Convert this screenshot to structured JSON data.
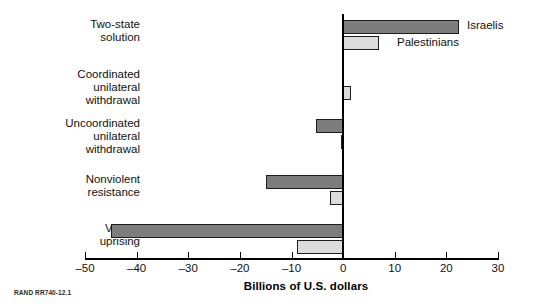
{
  "chart_data": {
    "type": "bar",
    "orientation": "horizontal",
    "title": "",
    "subtitle": "",
    "xlabel": "Billions of U.S. dollars",
    "ylabel": "",
    "xlim": [
      -50,
      30
    ],
    "xticks": [
      -50,
      -40,
      -30,
      -20,
      -10,
      0,
      10,
      20,
      30
    ],
    "xtick_labels": [
      "–50",
      "–40",
      "–30",
      "–20",
      "–10",
      "0",
      "10",
      "20",
      "30"
    ],
    "grid": false,
    "legend_position": "inline-right-of-bars",
    "categories": [
      "Two-state\nsolution",
      "Coordinated\nunilateral\nwithdrawal",
      "Uncoordinated\nunilateral\nwithdrawal",
      "Nonviolent\nresistance",
      "Violent\nuprising"
    ],
    "series": [
      {
        "name": "Israelis",
        "color": "#7d7d7d",
        "values": [
          22.4,
          -0.3,
          -5.2,
          -15.0,
          -45.0
        ]
      },
      {
        "name": "Palestinians",
        "color": "#dcdcdc",
        "values": [
          7.0,
          1.5,
          -0.4,
          -2.5,
          -9.0
        ]
      }
    ]
  },
  "legend": {
    "israelis_label": "Israelis",
    "palestinians_label": "Palestinians"
  },
  "axis": {
    "x_title": "Billions of U.S. dollars"
  },
  "source": {
    "note": "RAND RR740-12.1"
  }
}
